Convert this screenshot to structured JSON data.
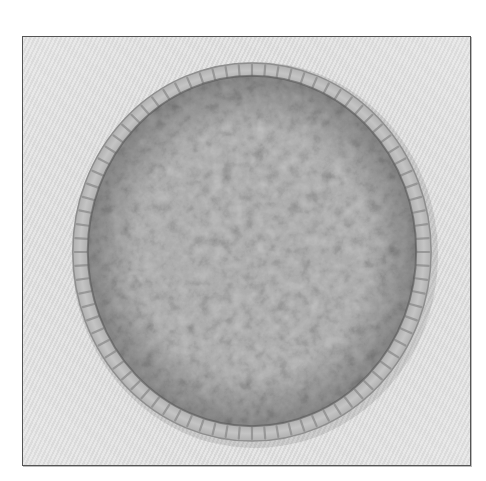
{
  "image": {
    "subject": "crumb-topped pie in fluted crust, top-down view",
    "palette": {
      "background": "#d8d8d8",
      "frame_border": "#555555",
      "crust": "#b9b9b9",
      "crust_shadow": "#8a8a8a",
      "crumb_base": "#6e6e6e",
      "crumb_light": "#a8a8a8",
      "crumb_dark": "#3c3c3c"
    },
    "alt_text": "Grayscale photo of a pie with crumb topping"
  }
}
